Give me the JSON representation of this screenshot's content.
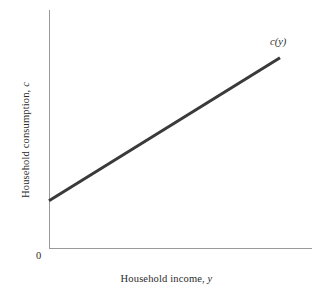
{
  "figure": {
    "background_color": "#ffffff",
    "origin_label": "0",
    "curve_label": "c(y)",
    "xlabel_text": "Household income,",
    "xlabel_symbol": "y",
    "ylabel_text": "Household consumption,",
    "ylabel_symbol": "c"
  },
  "chart_data": {
    "type": "line",
    "title": "",
    "subtitle": "",
    "xlabel": "Household income, y",
    "ylabel": "Household consumption, c",
    "grid": false,
    "legend": null,
    "legend_position": "none",
    "axis_color": "#999999",
    "series": [
      {
        "name": "c(y)",
        "color": "#3a3a3a",
        "line_width": 3,
        "annotation": "c(y)",
        "description": "Linear consumption function with positive intercept (autonomous consumption) and positive slope less than one (marginal propensity to consume).",
        "x": [
          0,
          1
        ],
        "y": [
          0.2,
          0.8
        ],
        "points": [
          {
            "x": 0,
            "y": 0.2
          },
          {
            "x": 1,
            "y": 0.8
          }
        ]
      }
    ],
    "xlim": [
      0,
      1
    ],
    "ylim": [
      0,
      1
    ],
    "xticks": [],
    "yticks": [],
    "xtick_labels": [],
    "ytick_labels": [],
    "origin_tick_label": "0"
  }
}
